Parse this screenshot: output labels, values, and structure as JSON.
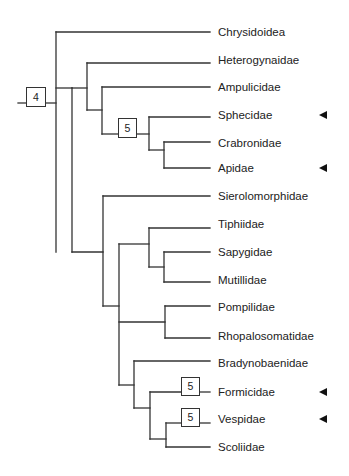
{
  "diagram": {
    "type": "cladogram",
    "line_color": "#333333",
    "taxa": [
      {
        "name": "Chrysidoidea",
        "y": 32,
        "marked": false
      },
      {
        "name": "Heterogynaidae",
        "y": 60,
        "marked": false
      },
      {
        "name": "Ampulicidae",
        "y": 87,
        "marked": false
      },
      {
        "name": "Sphecidae",
        "y": 115,
        "marked": true
      },
      {
        "name": "Crabronidae",
        "y": 143,
        "marked": false
      },
      {
        "name": "Apidae",
        "y": 168,
        "marked": true
      },
      {
        "name": "Sierolomorphidae",
        "y": 196,
        "marked": false
      },
      {
        "name": "Tiphiidae",
        "y": 224,
        "marked": false
      },
      {
        "name": "Sapygidae",
        "y": 252,
        "marked": false
      },
      {
        "name": "Mutillidae",
        "y": 280,
        "marked": false
      },
      {
        "name": "Pompilidae",
        "y": 307,
        "marked": false
      },
      {
        "name": "Rhopalosomatidae",
        "y": 336,
        "marked": false
      },
      {
        "name": "Bradynobaenidae",
        "y": 363,
        "marked": false
      },
      {
        "name": "Formicidae",
        "y": 392,
        "marked": true
      },
      {
        "name": "Vespidae",
        "y": 419,
        "marked": true
      },
      {
        "name": "Scoliidae",
        "y": 447,
        "marked": false
      }
    ],
    "boxes": [
      {
        "label": "4",
        "x": 26,
        "y": 87,
        "w": 20,
        "h": 20,
        "position": "root"
      },
      {
        "label": "5",
        "x": 118,
        "y": 118,
        "w": 19,
        "h": 20,
        "position": "Sphecidae+Crabronidae+Apidae clade"
      },
      {
        "label": "5",
        "x": 181,
        "y": 377,
        "w": 19,
        "h": 19,
        "position": "Formicidae"
      },
      {
        "label": "5",
        "x": 181,
        "y": 408,
        "w": 19,
        "h": 19,
        "position": "Vespidae"
      }
    ],
    "branches": [
      [
        18,
        103,
        26,
        103
      ],
      [
        46,
        103,
        56,
        103
      ],
      [
        56,
        32,
        56,
        252
      ],
      [
        56,
        32,
        210,
        32
      ],
      [
        56,
        88,
        72,
        88
      ],
      [
        72,
        88,
        72,
        252
      ],
      [
        72,
        88,
        87,
        88
      ],
      [
        87,
        63,
        87,
        110
      ],
      [
        87,
        63,
        210,
        63
      ],
      [
        87,
        110,
        102,
        110
      ],
      [
        102,
        87,
        102,
        134
      ],
      [
        102,
        87,
        210,
        87
      ],
      [
        102,
        134,
        118,
        134
      ],
      [
        137,
        134,
        149,
        134
      ],
      [
        149,
        117,
        149,
        150
      ],
      [
        149,
        117,
        210,
        117
      ],
      [
        149,
        150,
        164,
        150
      ],
      [
        164,
        142,
        164,
        168
      ],
      [
        164,
        142,
        210,
        142
      ],
      [
        164,
        168,
        210,
        168
      ],
      [
        72,
        252,
        103,
        252
      ],
      [
        103,
        196,
        103,
        306
      ],
      [
        103,
        196,
        210,
        196
      ],
      [
        103,
        306,
        119,
        306
      ],
      [
        119,
        244,
        119,
        385
      ],
      [
        119,
        244,
        149,
        244
      ],
      [
        149,
        228,
        149,
        267
      ],
      [
        149,
        228,
        210,
        228
      ],
      [
        149,
        267,
        164,
        267
      ],
      [
        164,
        252,
        164,
        282
      ],
      [
        164,
        252,
        210,
        252
      ],
      [
        164,
        282,
        210,
        282
      ],
      [
        119,
        322,
        165,
        322
      ],
      [
        165,
        306,
        165,
        338
      ],
      [
        165,
        306,
        210,
        306
      ],
      [
        165,
        338,
        210,
        338
      ],
      [
        119,
        385,
        134,
        385
      ],
      [
        134,
        361,
        134,
        408
      ],
      [
        134,
        361,
        210,
        361
      ],
      [
        134,
        408,
        150,
        408
      ],
      [
        150,
        392,
        150,
        439
      ],
      [
        150,
        392,
        181,
        392
      ],
      [
        200,
        392,
        210,
        392
      ],
      [
        150,
        439,
        166,
        439
      ],
      [
        166,
        423,
        166,
        447
      ],
      [
        166,
        423,
        181,
        423
      ],
      [
        200,
        423,
        210,
        423
      ],
      [
        166,
        447,
        210,
        447
      ]
    ]
  }
}
